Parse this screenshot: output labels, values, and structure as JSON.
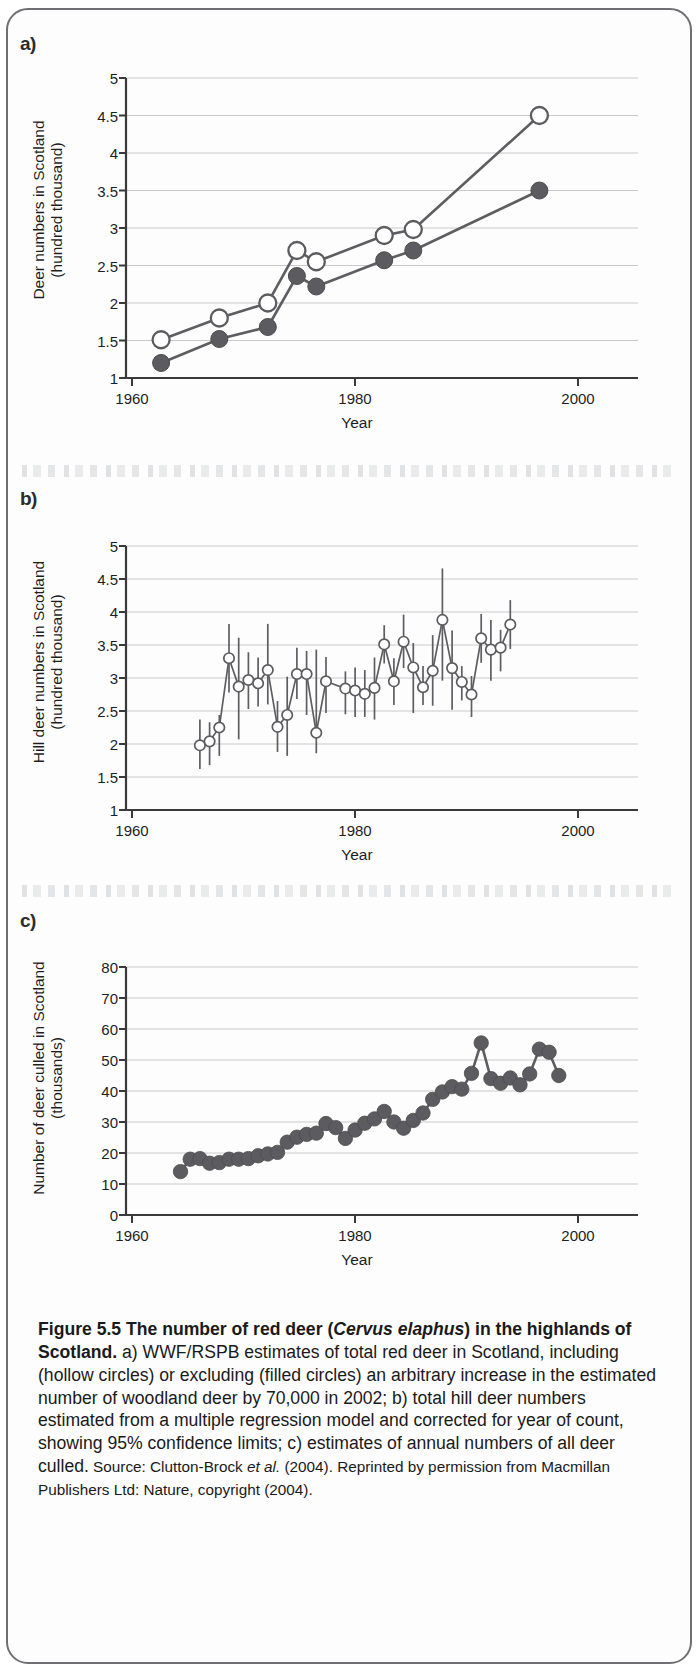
{
  "figure": {
    "border_color": "#6e6f72",
    "marker_color": "#5b5b60"
  },
  "panels": [
    {
      "letter": "a)",
      "ylabel_line1": "Deer numbers in Scotland",
      "ylabel_line2": "(hundred thousand)",
      "xlabel": "Year",
      "yticks": [
        "1",
        "1.5",
        "2",
        "2.5",
        "3",
        "3.5",
        "4",
        "4.5",
        "5"
      ],
      "xticks": [
        "1960",
        "1980",
        "2000"
      ]
    },
    {
      "letter": "b)",
      "ylabel_line1": "Hill deer numbers in Scotland",
      "ylabel_line2": "(hundred thousand)",
      "xlabel": "Year",
      "yticks": [
        "1",
        "1.5",
        "2",
        "2.5",
        "3",
        "3.5",
        "4",
        "4.5",
        "5"
      ],
      "xticks": [
        "1960",
        "1980",
        "2000"
      ]
    },
    {
      "letter": "c)",
      "ylabel_line1": "Number of deer culled in Scotland",
      "ylabel_line2": "(thousands)",
      "xlabel": "Year",
      "yticks": [
        "0",
        "10",
        "20",
        "30",
        "40",
        "50",
        "60",
        "70",
        "80"
      ],
      "xticks": [
        "1960",
        "1980",
        "2000"
      ]
    }
  ],
  "caption": {
    "bold_part": "Figure 5.5 The number of red deer (",
    "bold_italic": "Cervus elaphus",
    "bold_part2": ") in the highlands of Scotland.",
    "body": " a) WWF/RSPB estimates of total red deer in Scotland, including (hollow circles) or excluding (filled circles) an arbitrary increase in the estimated number of woodland deer by 70,000 in 2002; b) total hill deer numbers estimated from a multiple regression model and corrected for year of count, showing 95% confidence limits; c) estimates of annual numbers of all deer culled.",
    "source_lead": " Source: Clutton-Brock ",
    "source_italic": "et al.",
    "source_rest": " (2004). Reprinted by permission from Macmillan Publishers Ltd: Nature, copyright (2004)."
  },
  "chart_data": [
    {
      "type": "line",
      "panel": "a",
      "title": "WWF/RSPB estimates of total red deer in Scotland",
      "xlabel": "Year",
      "ylabel": "Deer numbers in Scotland (hundred thousand)",
      "xlim": [
        1960,
        2006
      ],
      "ylim": [
        1,
        5
      ],
      "xticks": [
        1960,
        1980,
        2000
      ],
      "yticks": [
        1,
        1.5,
        2,
        2.5,
        3,
        3.5,
        4,
        4.5,
        5
      ],
      "grid": "horizontal",
      "series": [
        {
          "name": "including woodland deer increase (hollow circles)",
          "marker": "hollow-circle",
          "x": [
            1963,
            1969,
            1974,
            1977,
            1979,
            1986,
            1989,
            2002
          ],
          "values": [
            1.51,
            1.8,
            2.0,
            2.7,
            2.55,
            2.9,
            2.98,
            4.5
          ]
        },
        {
          "name": "excluding woodland deer increase (filled circles)",
          "marker": "filled-circle",
          "x": [
            1963,
            1969,
            1974,
            1977,
            1979,
            1986,
            1989,
            2002
          ],
          "values": [
            1.2,
            1.52,
            1.68,
            2.36,
            2.22,
            2.57,
            2.7,
            3.5
          ]
        }
      ]
    },
    {
      "type": "line",
      "panel": "b",
      "title": "Total hill deer numbers estimated from a multiple regression model",
      "xlabel": "Year",
      "ylabel": "Hill deer numbers in Scotland (hundred thousand)",
      "xlim": [
        1960,
        2006
      ],
      "ylim": [
        1,
        5
      ],
      "xticks": [
        1960,
        1980,
        2000
      ],
      "yticks": [
        1,
        1.5,
        2,
        2.5,
        3,
        3.5,
        4,
        4.5,
        5
      ],
      "grid": "horizontal",
      "error_bars": "95% confidence limits",
      "marker": "hollow-circle",
      "x": [
        1967,
        1968,
        1969,
        1970,
        1971,
        1972,
        1973,
        1974,
        1975,
        1976,
        1977,
        1978,
        1979,
        1980,
        1982,
        1983,
        1984,
        1985,
        1986,
        1987,
        1988,
        1989,
        1990,
        1991,
        1992,
        1993,
        1994,
        1995,
        1996,
        1997,
        1998,
        1999
      ],
      "values": [
        1.98,
        2.04,
        2.25,
        3.3,
        2.87,
        2.97,
        2.92,
        3.12,
        2.26,
        2.44,
        3.06,
        3.06,
        2.17,
        2.95,
        2.84,
        2.81,
        2.76,
        2.85,
        3.51,
        2.95,
        3.55,
        3.16,
        2.86,
        3.11,
        3.88,
        3.15,
        2.94,
        2.75,
        3.6,
        3.43,
        3.46,
        3.81
      ],
      "err_lower": [
        1.62,
        1.68,
        1.82,
        2.78,
        2.07,
        2.53,
        2.57,
        2.6,
        1.88,
        1.82,
        2.68,
        2.44,
        1.86,
        2.47,
        2.45,
        2.41,
        2.41,
        2.37,
        3.22,
        2.59,
        3.15,
        2.47,
        2.59,
        2.58,
        2.96,
        2.52,
        2.66,
        2.41,
        3.23,
        2.96,
        3.1,
        3.44
      ],
      "err_upper": [
        2.37,
        2.33,
        2.44,
        3.82,
        3.61,
        3.39,
        3.31,
        3.82,
        2.65,
        3.02,
        3.46,
        3.41,
        3.43,
        3.32,
        3.1,
        3.16,
        3.12,
        3.31,
        3.8,
        3.3,
        3.96,
        3.53,
        3.18,
        3.65,
        4.66,
        3.72,
        3.18,
        3.03,
        3.97,
        3.88,
        3.73,
        4.18
      ]
    },
    {
      "type": "scatter",
      "panel": "c",
      "title": "Estimates of annual numbers of all deer culled",
      "xlabel": "Year",
      "ylabel": "Number of deer culled in Scotland (thousands)",
      "xlim": [
        1960,
        2006
      ],
      "ylim": [
        0,
        80
      ],
      "xticks": [
        1960,
        1980,
        2000
      ],
      "yticks": [
        0,
        10,
        20,
        30,
        40,
        50,
        60,
        70,
        80
      ],
      "grid": "horizontal",
      "marker": "filled-circle",
      "x": [
        1965,
        1966,
        1967,
        1968,
        1969,
        1970,
        1971,
        1972,
        1973,
        1974,
        1975,
        1976,
        1977,
        1978,
        1979,
        1980,
        1981,
        1982,
        1983,
        1984,
        1985,
        1986,
        1987,
        1988,
        1989,
        1990,
        1991,
        1992,
        1993,
        1994,
        1995,
        1996,
        1997,
        1998,
        1999,
        2000,
        2001,
        2002,
        2003,
        2004
      ],
      "values": [
        14.0,
        18.0,
        18.2,
        16.7,
        16.9,
        18.0,
        18.0,
        18.2,
        19.1,
        19.7,
        20.2,
        23.5,
        25.1,
        26.0,
        26.4,
        29.5,
        28.2,
        24.7,
        27.4,
        29.6,
        31.0,
        33.4,
        30.0,
        28.0,
        30.5,
        32.9,
        37.3,
        39.7,
        41.4,
        40.6,
        45.7,
        55.5,
        44.0,
        42.5,
        44.2,
        42.0,
        45.5,
        53.5,
        52.5,
        45.0
      ]
    }
  ]
}
